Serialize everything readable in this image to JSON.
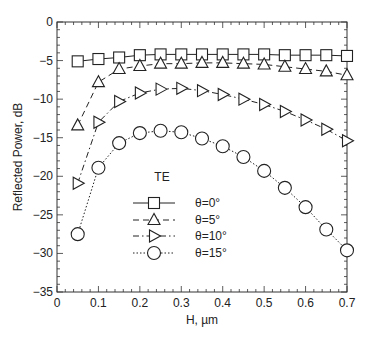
{
  "chart_data": {
    "type": "line",
    "title": "",
    "xlabel": "H, µm",
    "ylabel": "Reflected Power, dB",
    "xlim": [
      0,
      0.7
    ],
    "ylim": [
      -35,
      0
    ],
    "xticks": [
      0,
      0.1,
      0.2,
      0.3,
      0.4,
      0.5,
      0.6,
      0.7
    ],
    "xtick_labels": [
      "0",
      "0.1",
      "0.2",
      "0.3",
      "0.4",
      "0.5",
      "0.6",
      "0.7"
    ],
    "yticks": [
      0,
      -5,
      -10,
      -15,
      -20,
      -25,
      -30,
      -35
    ],
    "ytick_labels": [
      "0",
      "−5",
      "−10",
      "−15",
      "−20",
      "−25",
      "−30",
      "−35"
    ],
    "grid": false,
    "legend_title": "TE",
    "legend_position": "center-left inside plot",
    "x": [
      0.05,
      0.1,
      0.15,
      0.2,
      0.25,
      0.3,
      0.35,
      0.4,
      0.45,
      0.5,
      0.55,
      0.6,
      0.65,
      0.7
    ],
    "series": [
      {
        "name": "θ=0°",
        "marker": "square",
        "linestyle": "solid",
        "values": [
          -5.1,
          -4.8,
          -4.6,
          -4.3,
          -4.2,
          -4.2,
          -4.2,
          -4.2,
          -4.2,
          -4.2,
          -4.3,
          -4.3,
          -4.3,
          -4.4
        ]
      },
      {
        "name": "θ=5°",
        "marker": "triangle-up",
        "linestyle": "dashed",
        "values": [
          -13.4,
          -7.8,
          -6.1,
          -5.7,
          -5.4,
          -5.4,
          -5.3,
          -5.3,
          -5.4,
          -5.5,
          -5.8,
          -6.1,
          -6.4,
          -6.9
        ]
      },
      {
        "name": "θ=10°",
        "marker": "triangle-right",
        "linestyle": "dashdot",
        "values": [
          -20.9,
          -13.0,
          -10.3,
          -9.2,
          -8.7,
          -8.6,
          -8.9,
          -9.4,
          -10.0,
          -10.7,
          -11.6,
          -12.7,
          -13.9,
          -15.4
        ]
      },
      {
        "name": "θ=15°",
        "marker": "circle",
        "linestyle": "dotted",
        "values": [
          -27.5,
          -18.9,
          -15.7,
          -14.4,
          -14.1,
          -14.3,
          -15.1,
          -16.1,
          -17.5,
          -19.3,
          -21.5,
          -24.0,
          -26.9,
          -29.6
        ]
      }
    ]
  }
}
